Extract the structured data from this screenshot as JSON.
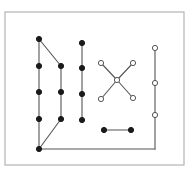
{
  "figure": {
    "name": "node-link-diagram",
    "background_color": "#ffffff",
    "width": 191,
    "height": 176
  },
  "frame": {
    "name": "plot-border",
    "x": 5,
    "y": 12,
    "width": 179,
    "height": 153,
    "stroke": "#b4b4b4",
    "stroke_width": 1.2
  },
  "style": {
    "edge_color": "#555555",
    "edge_width": 1.1,
    "filled_node_fill": "#1a1a1a",
    "filled_node_stroke": "#1a1a1a",
    "open_node_fill": "#ffffff",
    "open_node_stroke": "#555555",
    "node_radius": 2.6,
    "node_stroke_width": 1.0
  },
  "chart_data": {
    "type": "scatter",
    "title": "",
    "xlabel": "",
    "ylabel": "",
    "xlim": [
      0,
      191
    ],
    "ylim": [
      0,
      176
    ],
    "grid": false,
    "legend": "none",
    "node_groups": [
      {
        "name": "left-cluster-filled",
        "marker": "filled-circle",
        "nodes": [
          {
            "id": "L1",
            "x": 39,
            "y": 39
          },
          {
            "id": "L2",
            "x": 39,
            "y": 66
          },
          {
            "id": "L3",
            "x": 39,
            "y": 92
          },
          {
            "id": "L4",
            "x": 39,
            "y": 119
          },
          {
            "id": "L5",
            "x": 39,
            "y": 149
          },
          {
            "id": "M1",
            "x": 61,
            "y": 66
          },
          {
            "id": "M2",
            "x": 61,
            "y": 92
          },
          {
            "id": "M3",
            "x": 61,
            "y": 119
          }
        ]
      },
      {
        "name": "center-column-filled",
        "marker": "filled-circle",
        "nodes": [
          {
            "id": "C1",
            "x": 82,
            "y": 43
          },
          {
            "id": "C2",
            "x": 82,
            "y": 68
          },
          {
            "id": "C3",
            "x": 82,
            "y": 94
          },
          {
            "id": "C4",
            "x": 82,
            "y": 120
          }
        ]
      },
      {
        "name": "bottom-pair-filled",
        "marker": "filled-circle",
        "nodes": [
          {
            "id": "B1",
            "x": 104,
            "y": 130
          },
          {
            "id": "B2",
            "x": 131,
            "y": 130
          }
        ]
      },
      {
        "name": "x-cluster-open",
        "marker": "open-circle",
        "nodes": [
          {
            "id": "X1",
            "x": 101,
            "y": 63
          },
          {
            "id": "X2",
            "x": 133,
            "y": 63
          },
          {
            "id": "XC",
            "x": 117,
            "y": 80
          },
          {
            "id": "X3",
            "x": 101,
            "y": 99
          },
          {
            "id": "X4",
            "x": 133,
            "y": 98
          }
        ]
      },
      {
        "name": "right-column-open",
        "marker": "open-circle",
        "nodes": [
          {
            "id": "R1",
            "x": 155,
            "y": 48
          },
          {
            "id": "R2",
            "x": 155,
            "y": 83
          },
          {
            "id": "R3",
            "x": 155,
            "y": 115
          }
        ]
      }
    ],
    "edges": [
      {
        "from": "L1",
        "to": "L2"
      },
      {
        "from": "L2",
        "to": "L3"
      },
      {
        "from": "L3",
        "to": "L4"
      },
      {
        "from": "L4",
        "to": "L5"
      },
      {
        "from": "L1",
        "to": "M1"
      },
      {
        "from": "M1",
        "to": "M2"
      },
      {
        "from": "M2",
        "to": "M3"
      },
      {
        "from": "M3",
        "to": "L5"
      },
      {
        "from": "C1",
        "to": "C2"
      },
      {
        "from": "C2",
        "to": "C3"
      },
      {
        "from": "C3",
        "to": "C4"
      },
      {
        "from": "X1",
        "to": "XC"
      },
      {
        "from": "X2",
        "to": "XC"
      },
      {
        "from": "XC",
        "to": "X3"
      },
      {
        "from": "XC",
        "to": "X4"
      },
      {
        "from": "R1",
        "to": "R2"
      },
      {
        "from": "R2",
        "to": "R3"
      },
      {
        "from": "R3",
        "to": "RBEND"
      },
      {
        "from": "RBEND",
        "to": "L5"
      },
      {
        "from": "B1",
        "to": "B2"
      }
    ],
    "bend_points": [
      {
        "id": "RBEND",
        "x": 155,
        "y": 149
      }
    ]
  }
}
